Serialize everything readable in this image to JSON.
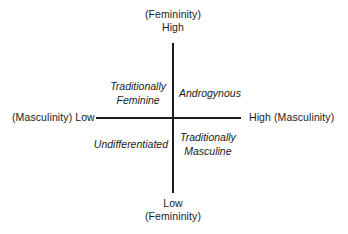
{
  "diagram": {
    "type": "two-axis-quadrant",
    "background_color": "#ffffff",
    "line_color": "#1c1c1c",
    "text_color": "#1a1a1a",
    "axes": {
      "vertical": {
        "construct": "Femininity",
        "top_label": {
          "construct": "(Femininity)",
          "level": "High"
        },
        "bottom_label": {
          "level": "Low",
          "construct": "(Femininity)"
        }
      },
      "horizontal": {
        "construct": "Masculinity",
        "left_label": "(Masculinity) Low",
        "right_label": "High (Masculinity)"
      }
    },
    "quadrants": {
      "top_left": {
        "line1": "Traditionally",
        "line2": "Feminine"
      },
      "top_right": {
        "line1": "Androgynous",
        "line2": ""
      },
      "bottom_left": {
        "line1": "Undifferentiated",
        "line2": ""
      },
      "bottom_right": {
        "line1": "Traditionally",
        "line2": "Masculine"
      }
    }
  }
}
